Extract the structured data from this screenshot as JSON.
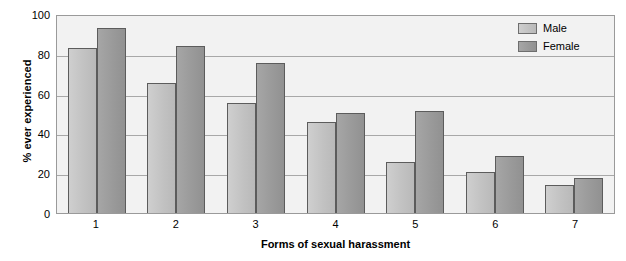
{
  "chart_data": {
    "type": "bar",
    "title": "",
    "xlabel": "Forms of sexual harassment",
    "ylabel": "% ever experienced",
    "categories": [
      "1",
      "2",
      "3",
      "4",
      "5",
      "6",
      "7"
    ],
    "series": [
      {
        "name": "Male",
        "color": "#c2c2c2",
        "values": [
          84,
          66,
          56,
          46,
          26,
          21,
          14
        ]
      },
      {
        "name": "Female",
        "color": "#9a9a9a",
        "values": [
          94,
          85,
          76,
          51,
          52,
          29,
          18
        ]
      }
    ],
    "ylim": [
      0,
      100
    ],
    "yticks": [
      0,
      20,
      40,
      60,
      80,
      100
    ],
    "ytick_labels": [
      "0",
      "20",
      "40",
      "60",
      "80",
      "100"
    ],
    "grid": true,
    "grid_axis": "y",
    "legend_position": "top-right",
    "plot_background": "#f2f2f2",
    "gridline_color": "#a8a8a8",
    "bar_border_color": "#5c5c5c"
  }
}
